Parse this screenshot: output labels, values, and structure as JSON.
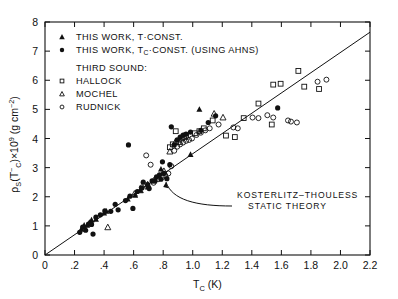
{
  "figure": {
    "background": "#ffffff",
    "ink": "#111111"
  },
  "axes": {
    "x": {
      "label": "T",
      "label_sub": "C",
      "label_units": "(K)",
      "label_full": "T_C (K)",
      "min": 0,
      "max": 2.2,
      "ticks": [
        0,
        0.2,
        0.4,
        0.6,
        0.8,
        1.0,
        1.2,
        1.4,
        1.6,
        1.8,
        2.0,
        2.2
      ],
      "tick_labels": [
        "0",
        ".2",
        ".4",
        ".6",
        ".8",
        "1.0",
        "1.2",
        "1.4",
        "1.6",
        "1.8",
        "2.0",
        "2.2"
      ]
    },
    "y": {
      "label_main": "ρ",
      "label_sub": "S",
      "label_arg": "(T",
      "label_arg_sup": "−",
      "label_arg_sub": "C",
      "label_arg_close": ")×10",
      "label_exp": "9",
      "label_units": "(g cm",
      "label_units_exp": "−2",
      "label_units_close": ")",
      "label_full": "ρS(T−C)×10⁹  (g cm⁻²)",
      "min": 0,
      "max": 8,
      "ticks": [
        0,
        1,
        2,
        3,
        4,
        5,
        6,
        7,
        8
      ],
      "tick_labels": [
        "0",
        "1",
        "2",
        "3",
        "4",
        "5",
        "6",
        "7",
        "8"
      ]
    }
  },
  "legend": {
    "entries": [
      {
        "marker": "filled-triangle",
        "label": "THIS WORK, T·CONST."
      },
      {
        "marker": "filled-circle",
        "label": "THIS WORK, Tᴄ·CONST. (USING AHNS)"
      }
    ],
    "entry2_parts": {
      "pre": "THIS WORK, T",
      "sub": "C",
      "post": "·CONST. (USING AHNS)"
    },
    "entry1_parts": {
      "pre": "THIS WORK, T",
      "post": "·CONST."
    },
    "group_title": "THIRD SOUND:",
    "group_entries": [
      {
        "marker": "open-square",
        "label": "HALLOCK"
      },
      {
        "marker": "open-triangle",
        "label": "MOCHEL"
      },
      {
        "marker": "open-circle",
        "label": "RUDNICK"
      }
    ]
  },
  "annotation": {
    "line1": "KOSTERLITZ–THOULESS",
    "line2": "STATIC THEORY"
  },
  "chart_data": {
    "type": "scatter",
    "title": "",
    "xlabel": "T_C (K)",
    "ylabel": "ρS(T−C)×10⁹ (g cm⁻²)",
    "xlim": [
      0,
      2.2
    ],
    "ylim": [
      0,
      8
    ],
    "grid": false,
    "legend_position": "upper-left",
    "theory_line": {
      "name": "Kosterlitz–Thouless static theory",
      "type": "line",
      "x": [
        0.0,
        2.2
      ],
      "y": [
        0.0,
        7.65
      ],
      "slope": 3.477,
      "intercept": 0.0
    },
    "series": [
      {
        "name": "THIS WORK, T·CONST.",
        "marker": "filled-triangle",
        "points": [
          [
            0.245,
            0.88
          ],
          [
            0.265,
            1.02
          ],
          [
            0.285,
            1.02
          ],
          [
            0.3,
            1.12
          ],
          [
            0.315,
            1.2
          ],
          [
            0.345,
            1.22
          ],
          [
            0.4,
            1.44
          ],
          [
            0.415,
            1.5
          ],
          [
            0.56,
            1.92
          ],
          [
            0.61,
            2.05
          ],
          [
            0.645,
            2.22
          ],
          [
            0.695,
            2.33
          ],
          [
            0.785,
            2.95
          ],
          [
            0.985,
            3.45
          ],
          [
            1.045,
            5.0
          ]
        ]
      },
      {
        "name": "THIS WORK, T_C·CONST. (USING AHNS)",
        "marker": "filled-circle",
        "points": [
          [
            0.235,
            0.78
          ],
          [
            0.255,
            0.96
          ],
          [
            0.275,
            0.85
          ],
          [
            0.295,
            1.06
          ],
          [
            0.315,
            1.05
          ],
          [
            0.325,
            0.72
          ],
          [
            0.345,
            1.3
          ],
          [
            0.375,
            1.38
          ],
          [
            0.405,
            1.52
          ],
          [
            0.445,
            1.5
          ],
          [
            0.475,
            1.74
          ],
          [
            0.495,
            1.55
          ],
          [
            0.545,
            1.87
          ],
          [
            0.575,
            2.02
          ],
          [
            0.595,
            1.6
          ],
          [
            0.625,
            2.18
          ],
          [
            0.655,
            2.3
          ],
          [
            0.665,
            2.5
          ],
          [
            0.695,
            2.42
          ],
          [
            0.705,
            2.28
          ],
          [
            0.725,
            2.55
          ],
          [
            0.745,
            2.55
          ],
          [
            0.755,
            2.68
          ],
          [
            0.775,
            2.75
          ],
          [
            0.785,
            2.6
          ],
          [
            0.795,
            3.2
          ],
          [
            0.805,
            2.8
          ],
          [
            0.825,
            2.62
          ],
          [
            0.845,
            3.1
          ],
          [
            0.855,
            4.4
          ],
          [
            0.875,
            3.78
          ],
          [
            0.895,
            3.95
          ],
          [
            0.915,
            4.05
          ],
          [
            0.935,
            4.12
          ],
          [
            0.955,
            4.15
          ],
          [
            0.985,
            4.22
          ],
          [
            1.055,
            4.28
          ],
          [
            1.105,
            4.55
          ],
          [
            1.155,
            4.78
          ],
          [
            1.575,
            5.05
          ],
          [
            0.565,
            3.78
          ]
        ]
      },
      {
        "name": "HALLOCK",
        "marker": "open-square",
        "points": [
          [
            0.845,
            3.7
          ],
          [
            0.865,
            3.8
          ],
          [
            0.885,
            4.25
          ],
          [
            0.905,
            3.88
          ],
          [
            0.925,
            4.0
          ],
          [
            0.955,
            4.1
          ],
          [
            1.015,
            4.18
          ],
          [
            1.045,
            4.25
          ],
          [
            1.075,
            4.35
          ],
          [
            1.135,
            4.62
          ],
          [
            1.225,
            4.1
          ],
          [
            1.345,
            4.7
          ],
          [
            1.445,
            5.2
          ],
          [
            1.545,
            5.85
          ],
          [
            1.595,
            5.88
          ],
          [
            1.715,
            6.32
          ],
          [
            1.755,
            5.78
          ],
          [
            1.855,
            5.7
          ],
          [
            1.535,
            4.48
          ],
          [
            1.285,
            4.05
          ]
        ]
      },
      {
        "name": "MOCHEL",
        "marker": "open-triangle",
        "points": [
          [
            0.425,
            0.95
          ],
          [
            0.605,
            2.1
          ],
          [
            0.645,
            2.22
          ],
          [
            0.695,
            2.42
          ],
          [
            0.735,
            2.55
          ],
          [
            0.805,
            2.88
          ],
          [
            0.845,
            3.55
          ],
          [
            0.885,
            3.9
          ],
          [
            0.945,
            4.05
          ],
          [
            1.145,
            4.85
          ],
          [
            1.205,
            4.72
          ]
        ]
      },
      {
        "name": "RUDNICK",
        "marker": "open-circle",
        "points": [
          [
            0.735,
            2.48
          ],
          [
            0.765,
            2.6
          ],
          [
            0.795,
            2.68
          ],
          [
            0.815,
            2.72
          ],
          [
            0.835,
            2.8
          ],
          [
            0.855,
            3.05
          ],
          [
            0.875,
            3.58
          ],
          [
            0.895,
            3.72
          ],
          [
            0.915,
            3.8
          ],
          [
            0.935,
            3.86
          ],
          [
            0.955,
            3.92
          ],
          [
            0.975,
            3.95
          ],
          [
            0.995,
            4.0
          ],
          [
            1.025,
            4.12
          ],
          [
            1.055,
            4.2
          ],
          [
            1.085,
            4.28
          ],
          [
            1.115,
            4.35
          ],
          [
            1.175,
            4.48
          ],
          [
            1.275,
            4.38
          ],
          [
            1.305,
            4.35
          ],
          [
            1.405,
            4.72
          ],
          [
            1.445,
            4.7
          ],
          [
            1.505,
            4.8
          ],
          [
            1.545,
            4.72
          ],
          [
            1.645,
            4.62
          ],
          [
            1.705,
            4.55
          ],
          [
            1.845,
            5.95
          ],
          [
            1.905,
            6.02
          ],
          [
            0.685,
            3.42
          ],
          [
            0.715,
            3.1
          ],
          [
            0.655,
            2.32
          ],
          [
            1.665,
            4.58
          ]
        ]
      }
    ]
  }
}
